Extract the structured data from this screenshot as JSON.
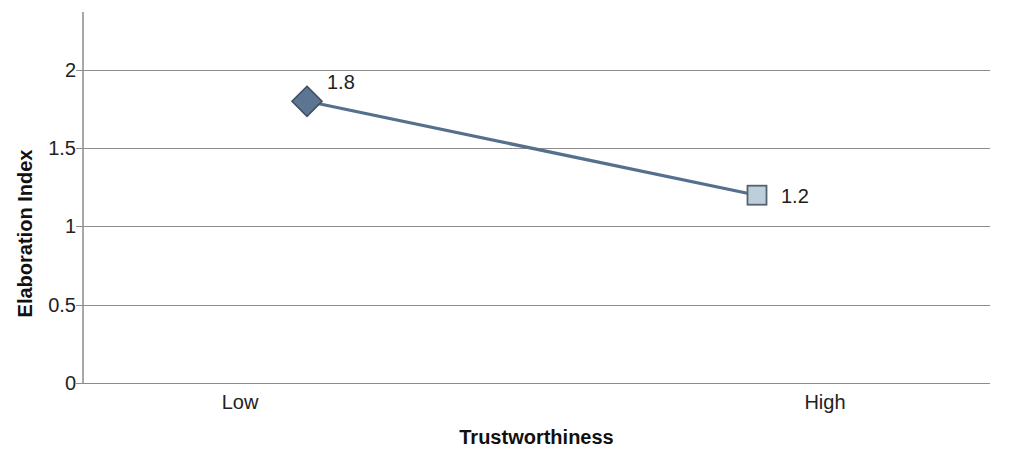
{
  "chart_data": {
    "type": "line",
    "title": "",
    "xlabel": "Trustworthiness",
    "ylabel": "Elaboration Index",
    "categories": [
      "Low",
      "High"
    ],
    "values": [
      1.8,
      1.2
    ],
    "point_labels": [
      "1.8",
      "1.2"
    ],
    "ylim": [
      0,
      2
    ],
    "ytick_labels": [
      "2",
      "1.5",
      "1",
      "0.5",
      "0"
    ],
    "ytick_values": [
      2,
      1.5,
      1,
      0.5,
      0
    ],
    "grid": "horizontal",
    "legend": "none",
    "series": [
      {
        "name": "Elaboration Index",
        "values": [
          1.8,
          1.2
        ],
        "line_color": "#55708c",
        "markers": [
          {
            "shape": "diamond",
            "fill": "#5c7592",
            "stroke": "#3f4f61"
          },
          {
            "shape": "square",
            "fill": "#bccfdb",
            "stroke": "#55636f"
          }
        ]
      }
    ],
    "colors": {
      "line": "#55708c",
      "marker_low_fill": "#5c7592",
      "marker_high_fill": "#bccfdb",
      "marker_stroke": "#475766",
      "gridline": "#8c8c8c",
      "axis": "#a8a8a8",
      "text": "#1d1d1d",
      "background": "#ffffff"
    }
  },
  "axis": {
    "y_title": "Elaboration Index",
    "x_title": "Trustworthiness",
    "y_ticks": [
      {
        "label": "2"
      },
      {
        "label": "1.5"
      },
      {
        "label": "1"
      },
      {
        "label": "0.5"
      },
      {
        "label": "0"
      }
    ],
    "x_ticks": [
      {
        "label": "Low"
      },
      {
        "label": "High"
      }
    ]
  },
  "labels": {
    "point_1": "1.8",
    "point_2": "1.2"
  }
}
